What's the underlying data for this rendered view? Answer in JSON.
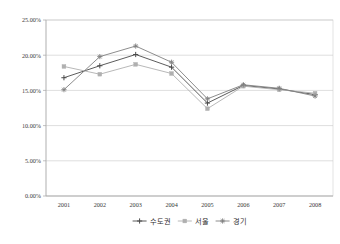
{
  "chart_data": {
    "type": "line",
    "title": "",
    "xlabel": "",
    "ylabel": "",
    "categories": [
      "2001",
      "2002",
      "2003",
      "2004",
      "2005",
      "2006",
      "2007",
      "2008"
    ],
    "ylim": [
      0,
      25
    ],
    "ytick_labels": [
      "0.00%",
      "5.00%",
      "10.00%",
      "15.00%",
      "20.00%",
      "25.00%"
    ],
    "ytick_values": [
      0,
      5,
      10,
      15,
      20,
      25
    ],
    "grid": true,
    "legend_position": "bottom",
    "series": [
      {
        "name": "수도권",
        "color": "#4a4a4a",
        "marker": "cross",
        "values": [
          16.8,
          18.5,
          20.1,
          18.3,
          13.2,
          15.7,
          15.2,
          14.4
        ]
      },
      {
        "name": "서울",
        "color": "#b0b0b0",
        "marker": "square",
        "values": [
          18.4,
          17.3,
          18.7,
          17.4,
          12.4,
          15.6,
          15.1,
          14.6
        ]
      },
      {
        "name": "경기",
        "color": "#808080",
        "marker": "star",
        "values": [
          15.1,
          19.8,
          21.3,
          19.0,
          13.8,
          15.8,
          15.3,
          14.2
        ]
      }
    ]
  },
  "caption": {
    "text": ""
  }
}
